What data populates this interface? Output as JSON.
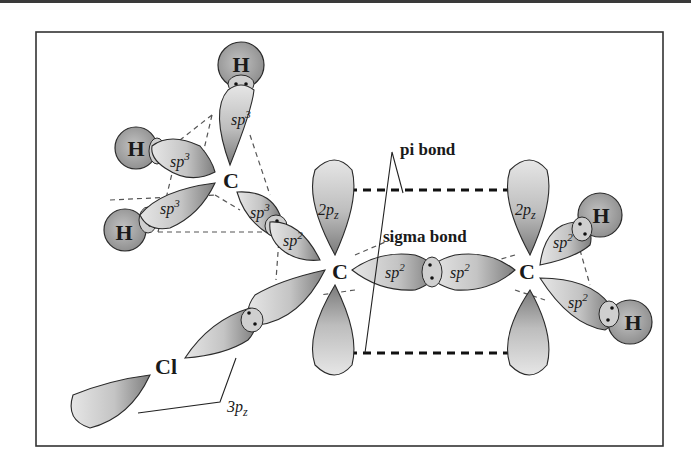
{
  "diagram": {
    "atoms": {
      "h_top": "H",
      "h_left_upper": "H",
      "h_left_lower": "H",
      "c_methyl": "C",
      "c_center": "C",
      "c_right": "C",
      "h_right_upper": "H",
      "h_right_lower": "H",
      "cl": "Cl"
    },
    "orbitals": {
      "sp3_top": "sp",
      "sp3_left_upper": "sp",
      "sp3_left_lower": "sp",
      "sp3_to_center": "sp",
      "sp2_from_center_to_methyl": "sp",
      "p_center": "2p",
      "p_right": "2p",
      "sp2_center_sigma": "sp",
      "sp2_right_sigma": "sp",
      "sp2_right_upper": "sp",
      "sp2_right_lower": "sp",
      "cl_3p": "3p"
    },
    "superscripts": {
      "sp3": "3",
      "sp2": "2"
    },
    "subscripts": {
      "z": "z"
    },
    "labels": {
      "pi_bond": "pi  bond",
      "sigma_bond": "sigma  bond",
      "cl_orbital": "3p"
    },
    "colors": {
      "lobe_light": "#e2e2e2",
      "lobe_dark": "#8a8a8a",
      "atom_fill": "#a8a8a8",
      "stroke": "#2a2a2a",
      "frame": "#333333"
    }
  }
}
